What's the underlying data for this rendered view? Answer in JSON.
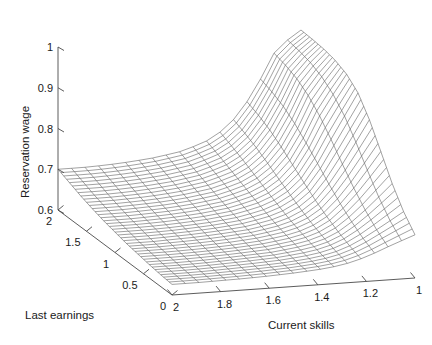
{
  "chart_data": {
    "type": "surface",
    "title": "",
    "xlabel": "Current skills",
    "ylabel": "Last earnings",
    "zlabel": "Reservation wage",
    "grid": false,
    "legend": "none",
    "projection": "3d-mesh-wireframe",
    "line_color": "#555555",
    "background": "#ffffff",
    "x_axis": {
      "label": "Current skills",
      "ticks": [
        "2",
        "1.8",
        "1.6",
        "1.4",
        "1.2",
        "1"
      ],
      "values": [
        2,
        1.8,
        1.6,
        1.4,
        1.2,
        1
      ],
      "range": [
        2,
        1
      ],
      "direction": "descending-left-to-right"
    },
    "y_axis": {
      "label": "Last earnings",
      "ticks": [
        "2",
        "1.5",
        "1",
        "0.5",
        "0"
      ],
      "values": [
        2,
        1.5,
        1,
        0.5,
        0
      ],
      "range": [
        2,
        0
      ],
      "direction": "descending-top-left-to-bottom-right"
    },
    "z_axis": {
      "label": "Reservation wage",
      "ticks": [
        "1",
        "0.9",
        "0.8",
        "0.7",
        "0.6"
      ],
      "values": [
        1,
        0.9,
        0.8,
        0.7,
        0.6
      ],
      "range": [
        0.6,
        1
      ]
    },
    "x_grid_values": [
      2,
      1.9,
      1.8,
      1.7,
      1.6,
      1.5,
      1.4,
      1.3,
      1.2,
      1.1,
      1
    ],
    "y_grid_values": [
      2,
      1.8,
      1.6,
      1.4,
      1.2,
      1,
      0.8,
      0.6,
      0.4,
      0.2,
      0
    ],
    "z_matrix": [
      [
        0.7,
        0.7,
        0.702,
        0.706,
        0.712,
        0.722,
        0.74,
        0.775,
        0.85,
        0.96,
        1.0
      ],
      [
        0.688,
        0.688,
        0.69,
        0.694,
        0.7,
        0.71,
        0.728,
        0.762,
        0.838,
        0.952,
        0.998
      ],
      [
        0.676,
        0.676,
        0.678,
        0.682,
        0.688,
        0.698,
        0.715,
        0.748,
        0.822,
        0.94,
        0.995
      ],
      [
        0.666,
        0.666,
        0.668,
        0.671,
        0.677,
        0.686,
        0.702,
        0.732,
        0.8,
        0.92,
        0.988
      ],
      [
        0.657,
        0.657,
        0.659,
        0.662,
        0.667,
        0.675,
        0.689,
        0.715,
        0.775,
        0.89,
        0.975
      ],
      [
        0.65,
        0.65,
        0.651,
        0.654,
        0.658,
        0.665,
        0.677,
        0.699,
        0.75,
        0.852,
        0.95
      ],
      [
        0.643,
        0.643,
        0.645,
        0.647,
        0.651,
        0.656,
        0.666,
        0.684,
        0.726,
        0.81,
        0.905
      ],
      [
        0.638,
        0.638,
        0.639,
        0.641,
        0.644,
        0.649,
        0.657,
        0.671,
        0.705,
        0.77,
        0.848
      ],
      [
        0.633,
        0.633,
        0.634,
        0.636,
        0.639,
        0.642,
        0.649,
        0.66,
        0.687,
        0.735,
        0.79
      ],
      [
        0.629,
        0.629,
        0.63,
        0.632,
        0.634,
        0.637,
        0.642,
        0.651,
        0.672,
        0.706,
        0.742
      ],
      [
        0.626,
        0.626,
        0.627,
        0.628,
        0.63,
        0.633,
        0.637,
        0.644,
        0.66,
        0.684,
        0.706
      ]
    ]
  },
  "axes": {
    "z": {
      "title": "Reservation wage",
      "ticks": [
        {
          "label": "1"
        },
        {
          "label": "0.9"
        },
        {
          "label": "0.8"
        },
        {
          "label": "0.7"
        },
        {
          "label": "0.6"
        }
      ]
    },
    "y": {
      "title": "Last earnings",
      "ticks": [
        {
          "label": "2"
        },
        {
          "label": "1.5"
        },
        {
          "label": "1"
        },
        {
          "label": "0.5"
        },
        {
          "label": "0"
        }
      ]
    },
    "x": {
      "title": "Current skills",
      "ticks": [
        {
          "label": "2"
        },
        {
          "label": "1.8"
        },
        {
          "label": "1.6"
        },
        {
          "label": "1.4"
        },
        {
          "label": "1.2"
        },
        {
          "label": "1"
        }
      ]
    }
  }
}
